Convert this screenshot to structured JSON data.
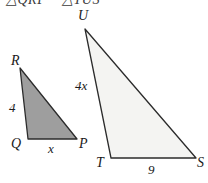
{
  "figure": {
    "similarity_statement": "△QRP ~ △TUS",
    "colors": {
      "small_triangle_fill": "#9e9e9e",
      "large_triangle_fill": "#f4f4f2",
      "stroke": "#2b2b2b",
      "text": "#1a1a1a",
      "background": "#ffffff"
    },
    "small_triangle": {
      "name": "triangle-QRP",
      "vertices": [
        {
          "label": "R",
          "x": 20,
          "y": 68,
          "label_x": 11,
          "label_y": 54
        },
        {
          "label": "Q",
          "x": 28,
          "y": 139,
          "label_x": 11,
          "label_y": 137
        },
        {
          "label": "P",
          "x": 77,
          "y": 139,
          "label_x": 79,
          "label_y": 137
        }
      ],
      "side_labels": [
        {
          "label": "4",
          "x": 9,
          "y": 101,
          "side": "RQ"
        },
        {
          "label": "x",
          "x": 48,
          "y": 142,
          "side": "QP"
        }
      ]
    },
    "large_triangle": {
      "name": "triangle-TUS",
      "vertices": [
        {
          "label": "U",
          "x": 85,
          "y": 29,
          "label_x": 78,
          "label_y": 9
        },
        {
          "label": "T",
          "x": 111,
          "y": 158,
          "label_x": 96,
          "label_y": 156
        },
        {
          "label": "S",
          "x": 196,
          "y": 158,
          "label_x": 197,
          "label_y": 156
        }
      ],
      "side_labels": [
        {
          "label": "4x",
          "x": 75,
          "y": 79,
          "side": "UT"
        },
        {
          "label": "9",
          "x": 148,
          "y": 163,
          "side": "TS"
        }
      ]
    }
  }
}
